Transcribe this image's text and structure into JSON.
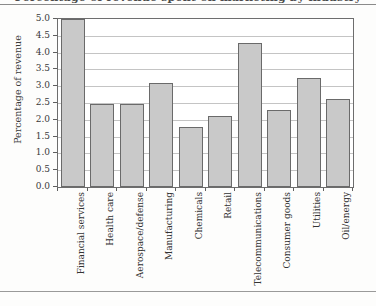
{
  "figure": {
    "title_clipped": "Percentage of revenue spent on marketing by industry",
    "ylabel": "Percentage of revenue"
  },
  "chart_data": {
    "type": "bar",
    "title": "Percentage of revenue spent on marketing by industry",
    "xlabel": "",
    "ylabel": "Percentage of revenue",
    "ylim": [
      0.0,
      5.0
    ],
    "ytick_labels": [
      "0.0",
      "0.5",
      "1.0",
      "1.5",
      "2.0",
      "2.5",
      "3.0",
      "3.5",
      "4.0",
      "4.5",
      "5.0"
    ],
    "ytick_values": [
      0.0,
      0.5,
      1.0,
      1.5,
      2.0,
      2.5,
      3.0,
      3.5,
      4.0,
      4.5,
      5.0
    ],
    "grid": "horizontal",
    "legend": "none",
    "bar_fill_color": "#c9c9c9",
    "bar_edge_color": "#6a6a6a",
    "categories": [
      "Financial services",
      "Health care",
      "Aerospace/defense",
      "Manufacturing",
      "Chemicals",
      "Retail",
      "Telecommunications",
      "Consumer goods",
      "Utilities",
      "Oil/energy"
    ],
    "values": [
      5.0,
      2.48,
      2.47,
      3.1,
      1.8,
      2.1,
      4.29,
      2.29,
      3.25,
      2.62
    ]
  }
}
